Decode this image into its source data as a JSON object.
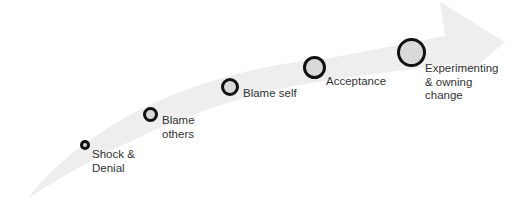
{
  "diagram": {
    "type": "curved-arrow-stages",
    "arrow_color": "#eeeeee",
    "circle_fill": "#d9d9d9",
    "circle_stroke": "#111111",
    "stages": [
      {
        "label": "Shock &\nDenial",
        "size": 10,
        "x": 80,
        "y": 140,
        "lx": 92,
        "ly": 148
      },
      {
        "label": "Blame\nothers",
        "size": 15,
        "x": 143,
        "y": 107,
        "lx": 162,
        "ly": 114
      },
      {
        "label": "Blame self",
        "size": 18,
        "x": 221,
        "y": 78,
        "lx": 243,
        "ly": 87
      },
      {
        "label": "Acceptance",
        "size": 23,
        "x": 303,
        "y": 56,
        "lx": 326,
        "ly": 75
      },
      {
        "label": "Experimenting\n& owning\nchange",
        "size": 29,
        "x": 397,
        "y": 38,
        "lx": 425,
        "ly": 62
      }
    ]
  }
}
